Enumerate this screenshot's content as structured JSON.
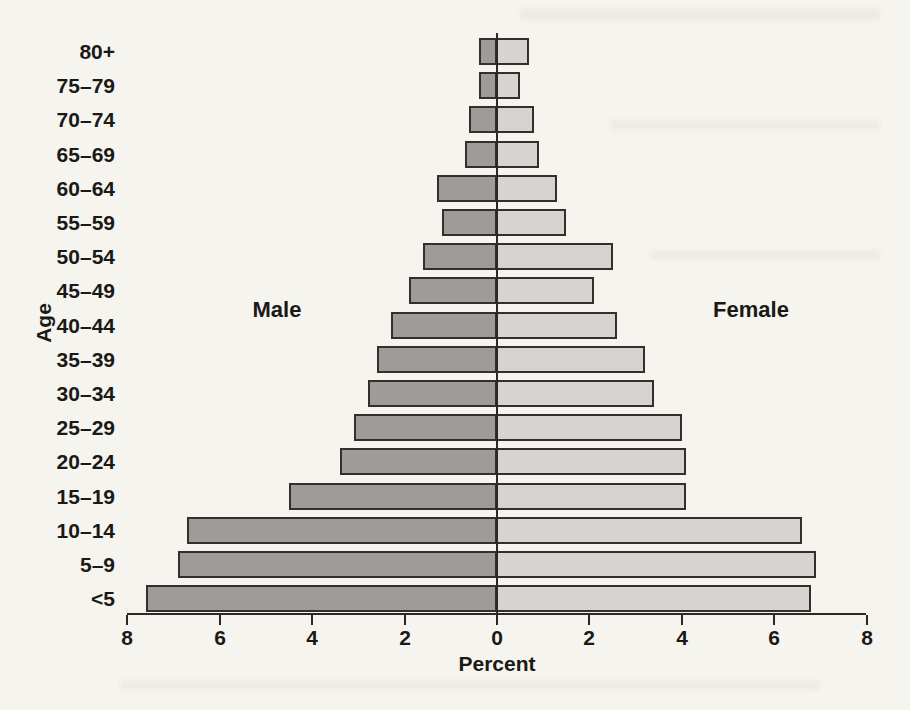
{
  "figure": {
    "ylabel": "Age",
    "xlabel": "Percent",
    "left_series_label": "Male",
    "right_series_label": "Female"
  },
  "chart_data": {
    "type": "bar",
    "subtype": "population_pyramid",
    "xlabel": "Percent",
    "ylabel": "Age",
    "axis": {
      "x_tick_labels": [
        "8",
        "6",
        "4",
        "2",
        "0",
        "2",
        "4",
        "6",
        "8"
      ],
      "x_tick_values_from_center": [
        -8,
        -6,
        -4,
        -2,
        0,
        2,
        4,
        6,
        8
      ],
      "x_max_each_side": 8,
      "x_tick_step": 2
    },
    "categories_top_to_bottom": [
      "80+",
      "75–79",
      "70–74",
      "65–69",
      "60–64",
      "55–59",
      "50–54",
      "45–49",
      "40–44",
      "35–39",
      "30–34",
      "25–29",
      "20–24",
      "15–19",
      "10–14",
      "5–9",
      "<5"
    ],
    "series": [
      {
        "name": "Male",
        "side": "left",
        "color": "#9d9c98",
        "values": [
          0.4,
          0.4,
          0.6,
          0.7,
          1.3,
          1.2,
          1.6,
          1.9,
          2.3,
          2.6,
          2.8,
          3.1,
          3.4,
          4.5,
          6.7,
          6.9,
          7.6
        ]
      },
      {
        "name": "Female",
        "side": "right",
        "color": "#d6d4d0",
        "values": [
          0.7,
          0.5,
          0.8,
          0.9,
          1.3,
          1.5,
          2.5,
          2.1,
          2.6,
          3.2,
          3.4,
          4.0,
          4.1,
          4.1,
          6.6,
          6.9,
          6.8
        ]
      }
    ]
  },
  "theme": {
    "bar_border": "#33302c",
    "axis_color": "#2b2925",
    "text_color": "#1b1916",
    "background": "#f5f4ef"
  }
}
